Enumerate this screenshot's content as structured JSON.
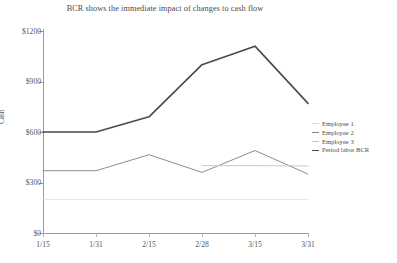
{
  "chart_data": {
    "type": "line",
    "title": "BCR shows the immediate impact of changes to cash flow",
    "xlabel": "",
    "ylabel": "Cash",
    "categories": [
      "1/15",
      "1/31",
      "2/15",
      "2/28",
      "3/15",
      "3/31"
    ],
    "ylim": [
      0,
      1200
    ],
    "yticks": [
      0,
      300,
      600,
      900,
      1200
    ],
    "ytick_labels": [
      "$0",
      "$300",
      "$600",
      "$900",
      "$1200"
    ],
    "grid": false,
    "legend_position": "right",
    "series": [
      {
        "name": "Employee 1",
        "color": "#dcdcdc",
        "width": 0.8,
        "values": [
          200,
          200,
          200,
          200,
          200,
          200
        ]
      },
      {
        "name": "Employee 2",
        "color": "#808080",
        "width": 0.9,
        "values": [
          370,
          370,
          465,
          360,
          490,
          350
        ]
      },
      {
        "name": "Employee 3",
        "color": "#c8c8c8",
        "width": 1.0,
        "values": [
          null,
          null,
          null,
          400,
          400,
          398
        ]
      },
      {
        "name": "Period labor BCR",
        "color": "#4a4a4a",
        "width": 1.6,
        "values": [
          600,
          600,
          690,
          1000,
          1110,
          770
        ]
      }
    ]
  }
}
